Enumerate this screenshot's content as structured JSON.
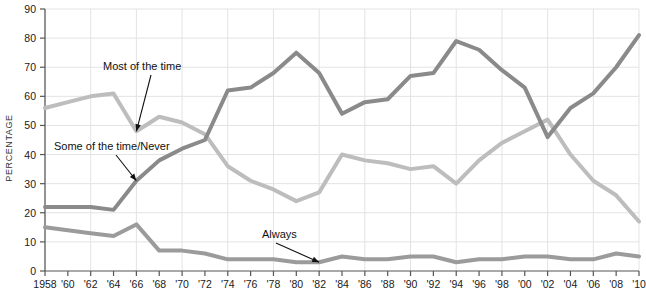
{
  "chart_data": {
    "type": "line",
    "title": "",
    "xlabel": "",
    "ylabel": "PERCENTAGE",
    "xlim": [
      1958,
      2010
    ],
    "ylim": [
      0,
      90
    ],
    "grid": true,
    "legend": "none (inline annotations)",
    "x": [
      1958,
      1960,
      1962,
      1964,
      1966,
      1968,
      1970,
      1972,
      1974,
      1976,
      1978,
      1980,
      1982,
      1984,
      1986,
      1988,
      1990,
      1992,
      1994,
      1996,
      1998,
      2000,
      2002,
      2004,
      2006,
      2008,
      2010
    ],
    "xtick_labels": [
      "1958",
      "'60",
      "'62",
      "'64",
      "'66",
      "'68",
      "'70",
      "'72",
      "'74",
      "'76",
      "'78",
      "'80",
      "'82",
      "'84",
      "'86",
      "'88",
      "'90",
      "'92",
      "'94",
      "'96",
      "'98",
      "'00",
      "'02",
      "'04",
      "'06",
      "'08",
      "'10"
    ],
    "ytick_labels": [
      "0",
      "10",
      "20",
      "30",
      "40",
      "50",
      "60",
      "70",
      "80",
      "90"
    ],
    "ytick_values": [
      0,
      10,
      20,
      30,
      40,
      50,
      60,
      70,
      80,
      90
    ],
    "series": [
      {
        "name": "Some of the time/Never",
        "color": "#8a8a8a",
        "values": [
          22,
          22,
          22,
          21,
          31,
          38,
          42,
          45,
          62,
          63,
          68,
          75,
          68,
          54,
          58,
          59,
          67,
          68,
          79,
          76,
          69,
          63,
          46,
          56,
          61,
          70,
          81
        ]
      },
      {
        "name": "Most of the time",
        "color": "#bdbdbd",
        "values": [
          56,
          58,
          60,
          61,
          48,
          53,
          51,
          47,
          36,
          31,
          28,
          24,
          27,
          40,
          38,
          37,
          35,
          36,
          30,
          38,
          44,
          48,
          52,
          40,
          31,
          26,
          17
        ]
      },
      {
        "name": "Always",
        "color": "#9b9b9b",
        "values": [
          15,
          14,
          13,
          12,
          16,
          7,
          7,
          6,
          4,
          4,
          4,
          3,
          3,
          5,
          4,
          4,
          5,
          5,
          3,
          4,
          4,
          5,
          5,
          4,
          4,
          6,
          5
        ]
      }
    ],
    "annotations": [
      {
        "label": "Most of the time",
        "series": "Most of the time",
        "text_x": 103,
        "text_y": 70
      },
      {
        "label": "Some of the time/Never",
        "series": "Some of the time/Never",
        "text_x": 54,
        "text_y": 150
      },
      {
        "label": "Always",
        "series": "Always",
        "text_x": 262,
        "text_y": 238
      }
    ]
  },
  "axis": {
    "y_axis_title": "PERCENTAGE"
  },
  "colors": {
    "dark_line": "#8a8a8a",
    "light_line": "#bdbdbd",
    "mid_line": "#9b9b9b",
    "grid": "#e3e3e3",
    "axis": "#555555",
    "text": "#1a1a1a"
  }
}
